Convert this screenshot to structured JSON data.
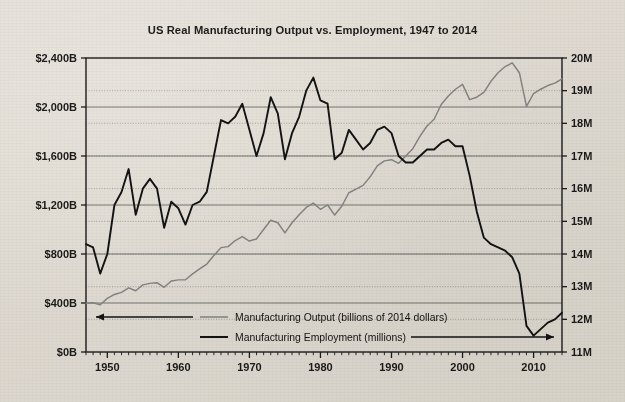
{
  "chart_data": {
    "type": "line",
    "title": "US Real Manufacturing Output vs. Employment, 1947 to 2014",
    "xlabel": "",
    "ylabel": "",
    "grid": true,
    "legend_position": "inside-bottom-left",
    "xlim": [
      1947,
      2014
    ],
    "x_ticks": [
      "1950",
      "1960",
      "1970",
      "1980",
      "1990",
      "2000",
      "2010"
    ],
    "x_tick_values": [
      1950,
      1960,
      1970,
      1980,
      1990,
      2000,
      2010
    ],
    "x_minor_tick_interval": 1,
    "axes": {
      "left": {
        "label": "",
        "ylim": [
          0,
          2400
        ],
        "tick_labels": [
          "$0B",
          "$400B",
          "$800B",
          "$1,200B",
          "$1,600B",
          "$2,000B",
          "$2,400B"
        ],
        "tick_values": [
          0,
          400,
          800,
          1200,
          1600,
          2000,
          2400
        ],
        "units": "billions of 2014 dollars"
      },
      "right": {
        "label": "",
        "ylim": [
          11,
          20
        ],
        "tick_labels": [
          "11M",
          "12M",
          "13M",
          "14M",
          "15M",
          "16M",
          "17M",
          "18M",
          "19M",
          "20M"
        ],
        "tick_values": [
          11,
          12,
          13,
          14,
          15,
          16,
          17,
          18,
          19,
          20
        ],
        "units": "millions"
      }
    },
    "series": [
      {
        "name": "Manufacturing Output (billions of 2014 dollars)",
        "axis": "left",
        "color": "#8d8d8d",
        "arrow_direction": "left",
        "x": [
          1947,
          1948,
          1949,
          1950,
          1951,
          1952,
          1953,
          1954,
          1955,
          1956,
          1957,
          1958,
          1959,
          1960,
          1961,
          1962,
          1963,
          1964,
          1965,
          1966,
          1967,
          1968,
          1969,
          1970,
          1971,
          1972,
          1973,
          1974,
          1975,
          1976,
          1977,
          1978,
          1979,
          1980,
          1981,
          1982,
          1983,
          1984,
          1985,
          1986,
          1987,
          1988,
          1989,
          1990,
          1991,
          1992,
          1993,
          1994,
          1995,
          1996,
          1997,
          1998,
          1999,
          2000,
          2001,
          2002,
          2003,
          2004,
          2005,
          2006,
          2007,
          2008,
          2009,
          2010,
          2011,
          2012,
          2013,
          2014
        ],
        "values": [
          398,
          402,
          386,
          438,
          470,
          487,
          524,
          500,
          548,
          560,
          566,
          528,
          580,
          589,
          590,
          638,
          678,
          718,
          787,
          852,
          860,
          910,
          942,
          906,
          923,
          1000,
          1075,
          1055,
          972,
          1055,
          1120,
          1180,
          1215,
          1165,
          1200,
          1118,
          1190,
          1300,
          1330,
          1360,
          1430,
          1520,
          1560,
          1570,
          1540,
          1600,
          1660,
          1760,
          1845,
          1900,
          2020,
          2090,
          2145,
          2185,
          2060,
          2080,
          2120,
          2210,
          2280,
          2330,
          2360,
          2280,
          2005,
          2110,
          2145,
          2175,
          2195,
          2230
        ]
      },
      {
        "name": "Manufacturing Employment (millions)",
        "axis": "right",
        "color": "#141414",
        "arrow_direction": "right",
        "x": [
          1947,
          1948,
          1949,
          1950,
          1951,
          1952,
          1953,
          1954,
          1955,
          1956,
          1957,
          1958,
          1959,
          1960,
          1961,
          1962,
          1963,
          1964,
          1965,
          1966,
          1967,
          1968,
          1969,
          1970,
          1971,
          1972,
          1973,
          1974,
          1975,
          1976,
          1977,
          1978,
          1979,
          1980,
          1981,
          1982,
          1983,
          1984,
          1985,
          1986,
          1987,
          1988,
          1989,
          1990,
          1991,
          1992,
          1993,
          1994,
          1995,
          1996,
          1997,
          1998,
          1999,
          2000,
          2001,
          2002,
          2003,
          2004,
          2005,
          2006,
          2007,
          2008,
          2009,
          2010,
          2011,
          2012,
          2013,
          2014
        ],
        "values": [
          14.3,
          14.2,
          13.4,
          14.0,
          15.5,
          15.9,
          16.6,
          15.2,
          16.0,
          16.3,
          16.0,
          14.8,
          15.6,
          15.4,
          14.9,
          15.5,
          15.6,
          15.9,
          17.0,
          18.1,
          18.0,
          18.2,
          18.6,
          17.8,
          17.0,
          17.7,
          18.8,
          18.3,
          16.9,
          17.7,
          18.2,
          19.0,
          19.4,
          18.7,
          18.6,
          16.9,
          17.1,
          17.8,
          17.5,
          17.2,
          17.4,
          17.8,
          17.9,
          17.7,
          17.0,
          16.8,
          16.8,
          17.0,
          17.2,
          17.2,
          17.4,
          17.5,
          17.3,
          17.3,
          16.4,
          15.3,
          14.5,
          14.3,
          14.2,
          14.1,
          13.9,
          13.4,
          11.8,
          11.5,
          11.7,
          11.9,
          12.0,
          12.2
        ]
      }
    ]
  },
  "legend": {
    "items": [
      {
        "label": "Manufacturing Output (billions of 2014 dollars)",
        "swatch_color": "#8d8d8d",
        "arrow": "left-arrow-icon"
      },
      {
        "label": "Manufacturing Employment (millions)",
        "swatch_color": "#141414",
        "arrow": "right-arrow-icon"
      }
    ]
  }
}
